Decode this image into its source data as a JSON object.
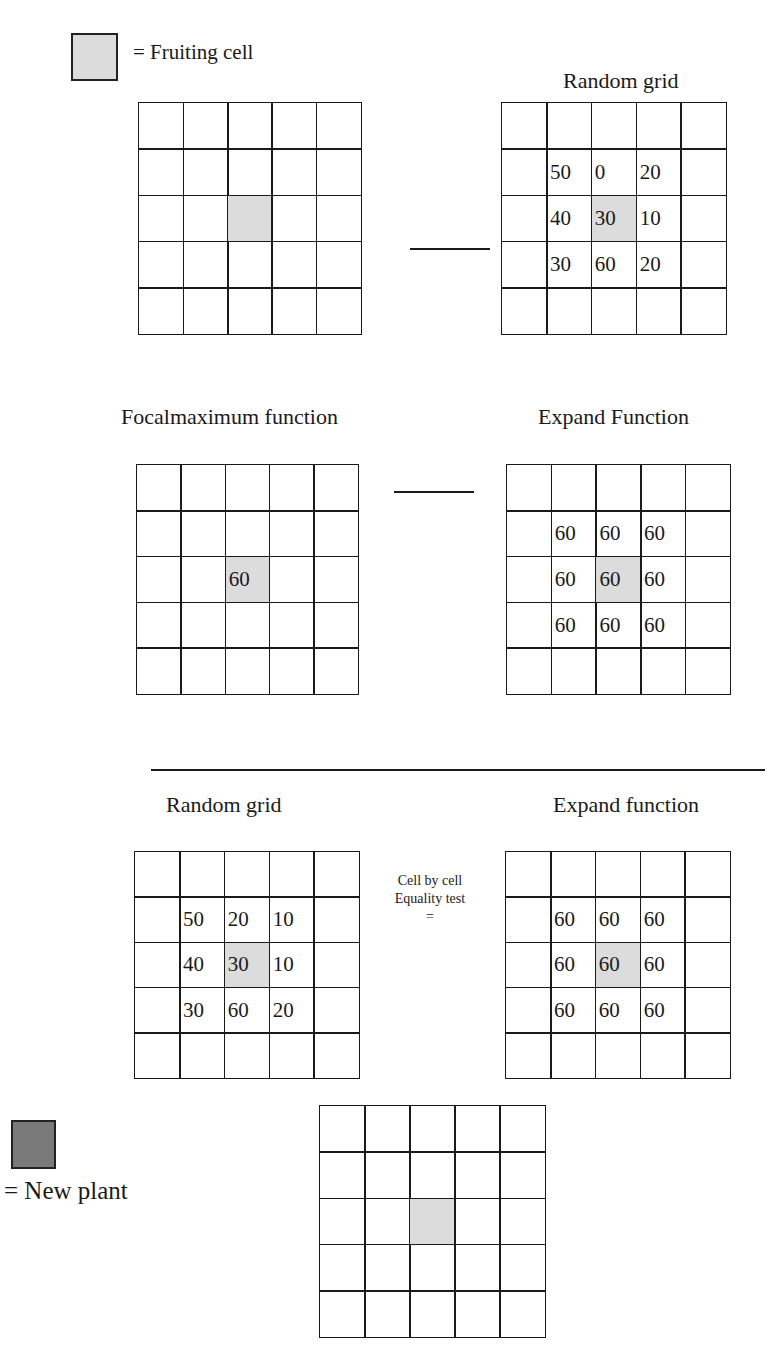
{
  "legend": {
    "fruiting": {
      "label": "= Fruiting cell",
      "color": "#dcdcdc"
    },
    "new_plant": {
      "label": "= New plant",
      "color": "#7a7a7a"
    }
  },
  "panels": [
    {
      "id": "p1",
      "title": "",
      "cells": [
        [
          "",
          "",
          "",
          "",
          ""
        ],
        [
          "",
          "",
          "",
          "",
          ""
        ],
        [
          "",
          "",
          "",
          "",
          ""
        ],
        [
          "",
          "",
          "",
          "",
          ""
        ],
        [
          "",
          "",
          "",
          "",
          ""
        ]
      ]
    },
    {
      "id": "p2",
      "title": "Random grid",
      "cells": [
        [
          "",
          "",
          "",
          "",
          ""
        ],
        [
          "",
          "50",
          "0",
          "20",
          ""
        ],
        [
          "",
          "40",
          "30",
          "10",
          ""
        ],
        [
          "",
          "30",
          "60",
          "20",
          ""
        ],
        [
          "",
          "",
          "",
          "",
          ""
        ]
      ]
    },
    {
      "id": "p3",
      "title": "Focalmaximum function",
      "cells": [
        [
          "",
          "",
          "",
          "",
          ""
        ],
        [
          "",
          "",
          "",
          "",
          ""
        ],
        [
          "",
          "",
          "60",
          "",
          ""
        ],
        [
          "",
          "",
          "",
          "",
          ""
        ],
        [
          "",
          "",
          "",
          "",
          ""
        ]
      ]
    },
    {
      "id": "p4",
      "title": "Expand Function",
      "cells": [
        [
          "",
          "",
          "",
          "",
          ""
        ],
        [
          "",
          "60",
          "60",
          "60",
          ""
        ],
        [
          "",
          "60",
          "60",
          "60",
          ""
        ],
        [
          "",
          "60",
          "60",
          "60",
          ""
        ],
        [
          "",
          "",
          "",
          "",
          ""
        ]
      ]
    },
    {
      "id": "p5",
      "title": "Random grid",
      "cells": [
        [
          "",
          "",
          "",
          "",
          ""
        ],
        [
          "",
          "50",
          "20",
          "10",
          ""
        ],
        [
          "",
          "40",
          "30",
          "10",
          ""
        ],
        [
          "",
          "30",
          "60",
          "20",
          ""
        ],
        [
          "",
          "",
          "",
          "",
          ""
        ]
      ]
    },
    {
      "id": "p6",
      "title": "Expand function",
      "cells": [
        [
          "",
          "",
          "",
          "",
          ""
        ],
        [
          "",
          "60",
          "60",
          "60",
          ""
        ],
        [
          "",
          "60",
          "60",
          "60",
          ""
        ],
        [
          "",
          "60",
          "60",
          "60",
          ""
        ],
        [
          "",
          "",
          "",
          "",
          ""
        ]
      ]
    },
    {
      "id": "p7",
      "title": "",
      "cells": [
        [
          "",
          "",
          "",
          "",
          ""
        ],
        [
          "",
          "",
          "",
          "",
          ""
        ],
        [
          "",
          "",
          "",
          "",
          ""
        ],
        [
          "",
          "",
          "",
          "",
          ""
        ],
        [
          "",
          "",
          "",
          "",
          ""
        ]
      ]
    }
  ],
  "equality_note": {
    "line1": "Cell by cell",
    "line2": "Equality test",
    "symbol": "="
  }
}
